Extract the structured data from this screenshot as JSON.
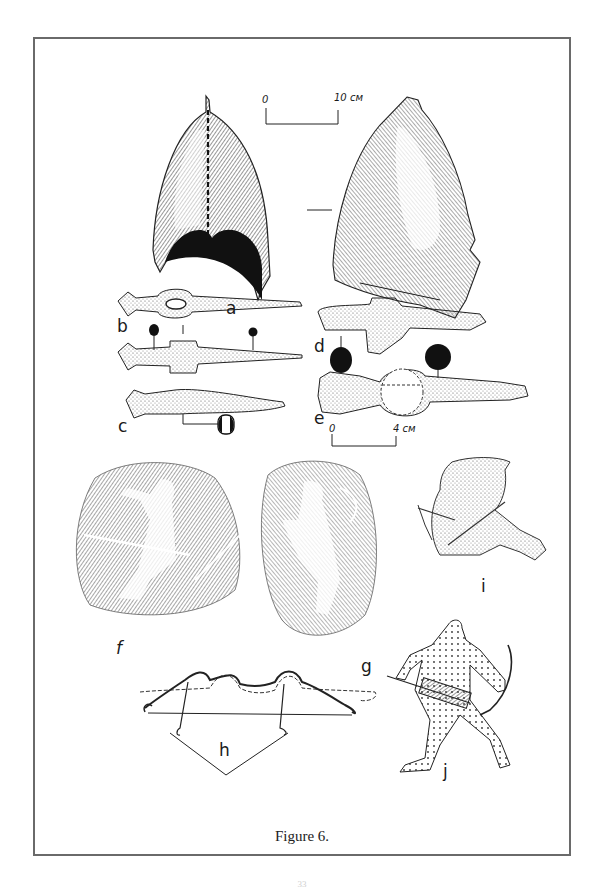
{
  "figure": {
    "caption": "Figure 6.",
    "page_number": "33",
    "panels": [
      {
        "id": "a",
        "label": "a",
        "subject": "helmet (two views)"
      },
      {
        "id": "b",
        "label": "b",
        "subject": "iron item with oval socket and sections"
      },
      {
        "id": "c",
        "label": "c",
        "subject": "iron item with cross-section"
      },
      {
        "id": "d",
        "label": "d",
        "subject": "iron item with cross-section"
      },
      {
        "id": "e",
        "label": "e",
        "subject": "iron item with cross-section"
      },
      {
        "id": "f",
        "label": "f",
        "subject": "relief: kneeling archer"
      },
      {
        "id": "g",
        "label": "g",
        "subject": "relief: archer with bow"
      },
      {
        "id": "h",
        "label": "h",
        "subject": "bow reconstruction"
      },
      {
        "id": "i",
        "label": "i",
        "subject": "seated archer stringing a bow"
      },
      {
        "id": "j",
        "label": "j",
        "subject": "running archer with quiver"
      }
    ],
    "scales": [
      {
        "id": "scale-helmet",
        "start": "0",
        "end": "10 см"
      },
      {
        "id": "scale-items",
        "start": "0",
        "end": "4 см"
      }
    ]
  }
}
